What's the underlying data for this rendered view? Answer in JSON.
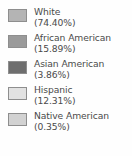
{
  "chart_data": {
    "type": "pie",
    "title": "",
    "subtitle": "",
    "xlabel": "",
    "ylabel": "",
    "legend_position": "standalone",
    "grid": false,
    "categories": [
      "White",
      "African American",
      "Asian American",
      "Hispanic",
      "Native American"
    ],
    "values": [
      74.4,
      15.89,
      3.86,
      12.31,
      0.35
    ],
    "value_labels": [
      "(74.40%)",
      "(15.89%)",
      "(3.86%)",
      "(12.31%)",
      "(0.35%)"
    ],
    "colors": [
      "#b4b4b4",
      "#9a9a9a",
      "#6e6e6e",
      "#e2e2e2",
      "#d2d2d2"
    ]
  },
  "legend": {
    "items": [
      {
        "label": "White",
        "percent": "(74.40%)",
        "color": "#b4b4b4"
      },
      {
        "label": "African American",
        "percent": "(15.89%)",
        "color": "#9a9a9a"
      },
      {
        "label": "Asian American",
        "percent": "(3.86%)",
        "color": "#6e6e6e"
      },
      {
        "label": "Hispanic",
        "percent": "(12.31%)",
        "color": "#e2e2e2"
      },
      {
        "label": "Native American",
        "percent": "(0.35%)",
        "color": "#d2d2d2"
      }
    ]
  }
}
